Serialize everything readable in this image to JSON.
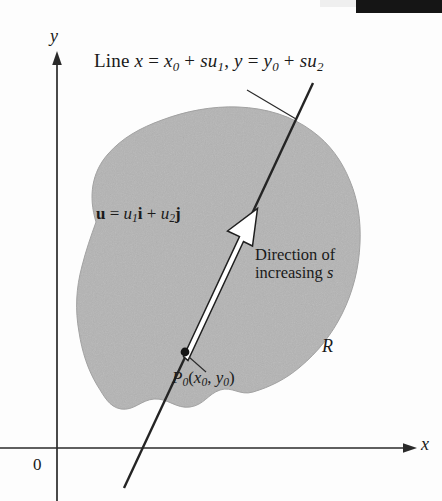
{
  "figure": {
    "type": "math-diagram",
    "background_color": "#fdfdfd",
    "region_fill_color": "#b4b4b4",
    "ink_color": "#1a1a1a"
  },
  "axes": {
    "y_label": "y",
    "x_label": "x",
    "origin_label": "0",
    "x_axis_y_px": 448,
    "y_axis_x_px": 57,
    "x_axis_arrow_tip_px": 416,
    "y_axis_arrow_tip_px": 52
  },
  "labels": {
    "line_equation": {
      "prefix": "Line ",
      "var_x": "x",
      "eq1": " = ",
      "x0_base": "x",
      "x0_sub": "0",
      "plus1": " + ",
      "s1": "s",
      "u1_base": "u",
      "u1_sub": "1",
      "comma": ", ",
      "var_y": "y",
      "eq2": " = ",
      "y0_base": "y",
      "y0_sub": "0",
      "plus2": " + ",
      "s2": "s",
      "u2_base": "u",
      "u2_sub": "2",
      "plain": "Line x = x0 + su1, y = y0 + su2"
    },
    "vector_equation": {
      "u_bold": "u",
      "eq": " = ",
      "u1_base": "u",
      "u1_sub": "1",
      "i_bold": "i",
      "plus": " + ",
      "u2_base": "u",
      "u2_sub": "2",
      "j_bold": "j",
      "plain": "u = u1 i + u2 j"
    },
    "direction_line1": "Direction of",
    "direction_line2_prefix": "increasing ",
    "direction_line2_var": "s",
    "point": {
      "p_base": "P",
      "p_sub": "0",
      "open": "(",
      "x_base": "x",
      "x_sub": "0",
      "comma": ", ",
      "y_base": "y",
      "y_sub": "0",
      "close": ")",
      "plain": "P0(x0, y0)"
    },
    "region": "R"
  },
  "geometry": {
    "point_P0_px": [
      185,
      352
    ],
    "vector_arrow_tip_px": [
      256,
      210
    ],
    "line_top_px": [
      313,
      83
    ],
    "line_bottom_px": [
      124,
      488
    ],
    "leader_equation_start_px": [
      247,
      90
    ],
    "leader_equation_end_px": [
      296,
      119
    ]
  }
}
